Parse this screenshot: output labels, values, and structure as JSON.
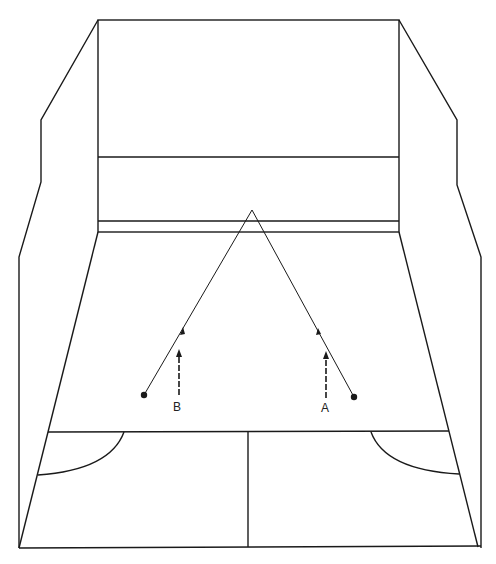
{
  "diagram": {
    "line_color": "#1a1a1a",
    "background": "#ffffff",
    "players": [
      {
        "label": "A",
        "label_pos": [
          321,
          409
        ],
        "ball": [
          354,
          397
        ],
        "arrow": {
          "x": 326,
          "y_from": 397,
          "y_to": 352
        }
      },
      {
        "label": "B",
        "label_pos": [
          173,
          408
        ],
        "ball": [
          144,
          395
        ],
        "arrow": {
          "x": 179,
          "y_from": 395,
          "y_to": 350
        }
      }
    ],
    "ball_path_apex": [
      252,
      210
    ]
  }
}
